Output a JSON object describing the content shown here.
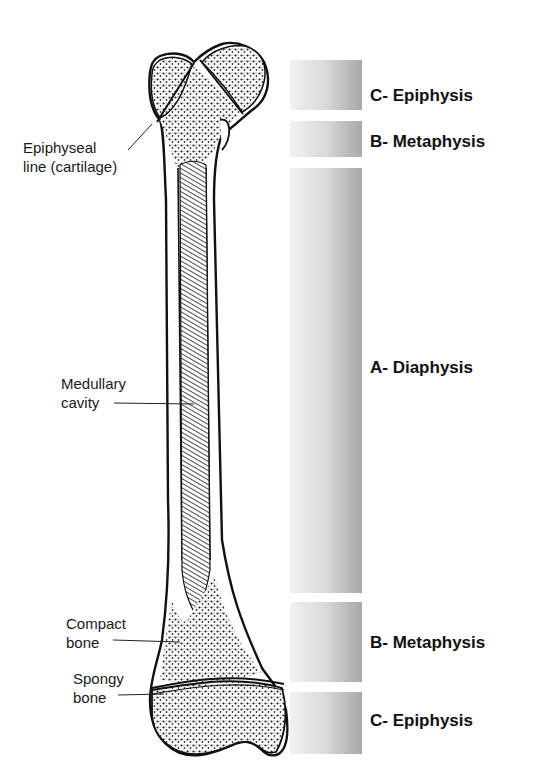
{
  "figure": {
    "labels": {
      "epiphyseal_line": [
        "Epiphyseal",
        "line (cartilage)"
      ],
      "medullary_cavity": [
        "Medullary",
        "cavity"
      ],
      "compact_bone": [
        "Compact",
        "bone"
      ],
      "spongy_bone": [
        "Spongy",
        "bone"
      ]
    },
    "regions": [
      {
        "label": "C- Epiphysis",
        "top": 60,
        "height": 50
      },
      {
        "label": "B- Metaphysis",
        "top": 121,
        "height": 36
      },
      {
        "label": "A- Diaphysis",
        "top": 168,
        "height": 425
      },
      {
        "label": "B- Metaphysis",
        "top": 602,
        "height": 80
      },
      {
        "label": "C- Epiphysis",
        "top": 692,
        "height": 62
      }
    ],
    "colors": {
      "bar_light": "#f2f2f2",
      "bar_dark": "#a8a8a8",
      "ink": "#111111"
    }
  }
}
